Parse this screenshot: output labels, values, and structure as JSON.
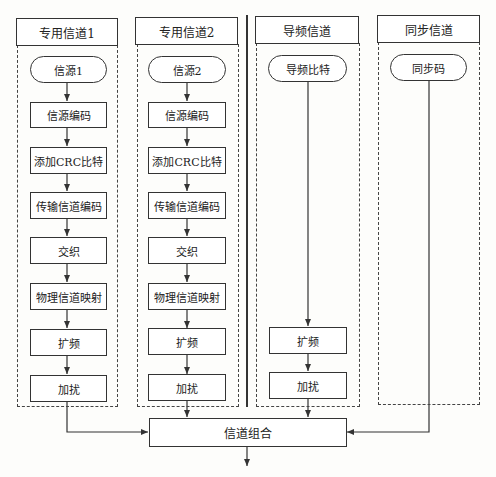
{
  "columns": [
    {
      "title": "专用信道1",
      "source": "信源1",
      "steps": [
        "信源编码",
        "添加CRC比特",
        "传输信道编码",
        "交织",
        "物理信道映射",
        "扩频",
        "加扰"
      ]
    },
    {
      "title": "专用信道2",
      "source": "信源2",
      "steps": [
        "信源编码",
        "添加CRC比特",
        "传输信道编码",
        "交织",
        "物理信道映射",
        "扩频",
        "加扰"
      ]
    },
    {
      "title": "导频信道",
      "source": "导频比特",
      "steps": [
        "扩频",
        "加扰"
      ]
    },
    {
      "title": "同步信道",
      "source": "同步码",
      "steps": []
    }
  ],
  "combiner": {
    "label": "信道组合"
  },
  "colors": {
    "line": "#333333",
    "background": "#fdfdfb"
  }
}
